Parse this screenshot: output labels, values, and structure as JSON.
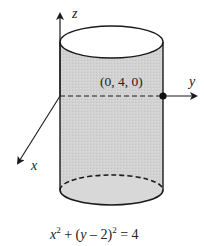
{
  "diagram": {
    "type": "3d-cylinder",
    "axes": {
      "z_label": "z",
      "y_label": "y",
      "x_label": "x"
    },
    "point": {
      "label": "(0, 4, 0)"
    },
    "equation": {
      "x_term": "x",
      "x_exp": "2",
      "plus": " + (",
      "y_term": "y",
      "minus_two": " – 2)",
      "y_exp": "2",
      "rhs": " = 4"
    },
    "colors": {
      "surface_fill": "#d4d4d4",
      "top_fill": "#ffffff",
      "stroke": "#1a1a1a"
    }
  }
}
